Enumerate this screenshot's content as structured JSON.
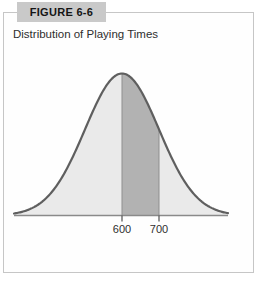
{
  "figure": {
    "label": "FIGURE 6-6",
    "title": "Distribution of Playing Times"
  },
  "chart_data": {
    "type": "area",
    "subtype": "normal-distribution-curve",
    "title": "Distribution of Playing Times",
    "mean": 600,
    "x_tick_labels": [
      "600",
      "700"
    ],
    "shaded_region": {
      "from": 600,
      "to": 700
    },
    "xlabel": "",
    "ylabel": "",
    "axis_style": "horizontal-baseline-only",
    "legend": "none",
    "grid": false,
    "colors": {
      "fill_light": "#eaeaea",
      "fill_dark": "#b2b2b2",
      "curve_stroke": "#5f5f5f",
      "baseline": "#8a8a8a",
      "divider_line": "#8f8f8f",
      "tick": "#4f4f4f",
      "tick_label": "#2f2f2f",
      "header_bg": "#c9c9c9",
      "frame_border": "#c6c6c6"
    }
  }
}
